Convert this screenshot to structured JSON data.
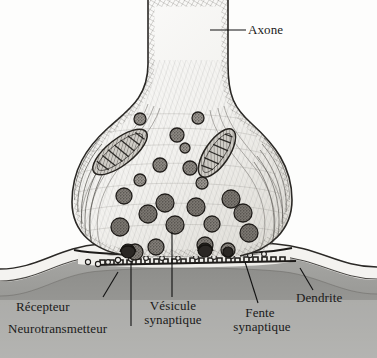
{
  "figure": {
    "style": "pen-and-ink engraving",
    "background_color": "#fdfdfc",
    "ink_color": "#1a1a1a"
  },
  "labels": [
    {
      "id": "axone",
      "text": "Axone",
      "x": 248,
      "y": 30,
      "align": "left"
    },
    {
      "id": "recepteur",
      "text": "Récepteur",
      "x": 16,
      "y": 300,
      "align": "left"
    },
    {
      "id": "neurotransmetteur",
      "text": "Neurotransmetteur",
      "x": 8,
      "y": 322,
      "align": "left"
    },
    {
      "id": "vesicule-l1",
      "text": "Vésicule",
      "x": 153,
      "y": 300,
      "align": "center"
    },
    {
      "id": "vesicule-l2",
      "text": "synaptique",
      "x": 148,
      "y": 315,
      "align": "center"
    },
    {
      "id": "fente-l1",
      "text": "Fente",
      "x": 248,
      "y": 307,
      "align": "center"
    },
    {
      "id": "fente-l2",
      "text": "synaptique",
      "x": 238,
      "y": 322,
      "align": "center"
    },
    {
      "id": "dendrite",
      "text": "Dendrite",
      "x": 296,
      "y": 292,
      "align": "left"
    }
  ],
  "structures": {
    "axon": {
      "name": "Axone",
      "description": "vertical shaft with microtubule striations"
    },
    "terminal_bouton": {
      "name": "Bouton terminal",
      "description": "flask-shaped presynaptic ending"
    },
    "mitochondria": [
      {
        "cx": 120,
        "cy": 152,
        "rx": 32,
        "ry": 13,
        "rot": -38
      },
      {
        "cx": 216,
        "cy": 153,
        "rx": 27,
        "ry": 12,
        "rot": -55
      }
    ],
    "vesicles": [
      {
        "cx": 140,
        "cy": 119,
        "r": 6
      },
      {
        "cx": 198,
        "cy": 118,
        "r": 6
      },
      {
        "cx": 177,
        "cy": 135,
        "r": 7
      },
      {
        "cx": 185,
        "cy": 148,
        "r": 5
      },
      {
        "cx": 160,
        "cy": 165,
        "r": 7
      },
      {
        "cx": 190,
        "cy": 168,
        "r": 7
      },
      {
        "cx": 140,
        "cy": 180,
        "r": 6
      },
      {
        "cx": 202,
        "cy": 183,
        "r": 6
      },
      {
        "cx": 124,
        "cy": 196,
        "r": 8
      },
      {
        "cx": 165,
        "cy": 203,
        "r": 9
      },
      {
        "cx": 196,
        "cy": 207,
        "r": 9
      },
      {
        "cx": 231,
        "cy": 199,
        "r": 9
      },
      {
        "cx": 148,
        "cy": 214,
        "r": 9
      },
      {
        "cx": 120,
        "cy": 227,
        "r": 9
      },
      {
        "cx": 175,
        "cy": 225,
        "r": 9
      },
      {
        "cx": 212,
        "cy": 224,
        "r": 8
      },
      {
        "cx": 243,
        "cy": 213,
        "r": 9
      },
      {
        "cx": 249,
        "cy": 233,
        "r": 9
      },
      {
        "cx": 156,
        "cy": 247,
        "r": 8
      },
      {
        "cx": 205,
        "cy": 245,
        "r": 8
      },
      {
        "cx": 135,
        "cy": 252,
        "r": 8
      },
      {
        "cx": 228,
        "cy": 250,
        "r": 7
      }
    ],
    "synaptic_cleft": {
      "name": "Fente synaptique",
      "description": "gap between presynaptic and postsynaptic membranes"
    },
    "receptors": {
      "name": "Récepteur",
      "description": "toothed band on postsynaptic membrane"
    },
    "neurotransmitter": {
      "name": "Neurotransmetteur",
      "description": "small particles released into the cleft"
    },
    "dendrite": {
      "name": "Dendrite",
      "description": "postsynaptic wavy cell body"
    }
  }
}
